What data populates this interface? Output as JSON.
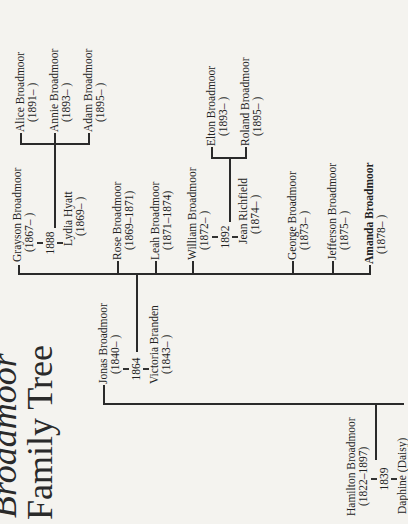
{
  "title": {
    "line1": "Broadmoor",
    "line2": "Family Tree"
  },
  "generation1": {
    "patriarch": {
      "name": "Hamilton Broadmoor",
      "years": "(1822–1897)"
    },
    "marriage_year": "1839",
    "spouse": {
      "name": "Daphine (Daisy)",
      "years": ""
    }
  },
  "generation2": {
    "son": {
      "name": "Jonas Broadmoor",
      "years": "(1840–    )"
    },
    "marriage_year": "1864",
    "spouse": {
      "name": "Victoria Branden",
      "years": "(1843–    )"
    }
  },
  "generation3": [
    {
      "name": "Grayson Broadmoor",
      "years": "(1867–    )",
      "bold": false
    },
    {
      "name": "Rose Broadmoor",
      "years": "(1869–1871)",
      "bold": false
    },
    {
      "name": "Leah Broadmoor",
      "years": "(1871–1874)",
      "bold": false
    },
    {
      "name": "William Broadmoor",
      "years": "(1872–    )",
      "bold": false
    },
    {
      "name": "George Broadmoor",
      "years": "(1873–    )",
      "bold": false
    },
    {
      "name": "Jefferson Broadmoor",
      "years": "(1875–    )",
      "bold": false
    },
    {
      "name": "Amanda Broadmoor",
      "years": "(1878–    )",
      "bold": true
    }
  ],
  "grayson_family": {
    "marriage_year": "1888",
    "spouse": {
      "name": "Lydia Hyatt",
      "years": "(1869–    )"
    },
    "children": [
      {
        "name": "Alice Broadmoor",
        "years": "(1891–    )"
      },
      {
        "name": "Annie Broadmoor",
        "years": "(1893–    )"
      },
      {
        "name": "Adam Broadmoor",
        "years": "(1895–    )"
      }
    ]
  },
  "william_family": {
    "marriage_year": "1892",
    "spouse": {
      "name": "Jean Richfield",
      "years": "(1874–    )"
    },
    "children": [
      {
        "name": "Elton Broadmoor",
        "years": "(1893–    )"
      },
      {
        "name": "Roland Broadmoor",
        "years": "(1895–    )"
      }
    ]
  }
}
